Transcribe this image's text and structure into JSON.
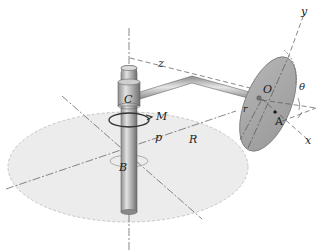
{
  "figure": {
    "type": "mechanics-diagram",
    "labels": {
      "C": "C",
      "B": "B",
      "M": "M",
      "p": "p",
      "R": "R",
      "O": "O",
      "A": "A",
      "r": "r",
      "theta": "θ",
      "x": "x",
      "y": "y",
      "z": "z"
    },
    "colors": {
      "base_fill": "#ebebeb",
      "base_edge": "#c8c8c8",
      "shaft": "#a9a9a9",
      "disc_fill": "#a8a8a8",
      "disc_edge": "#7a7a7a",
      "lines": "#555555"
    }
  }
}
